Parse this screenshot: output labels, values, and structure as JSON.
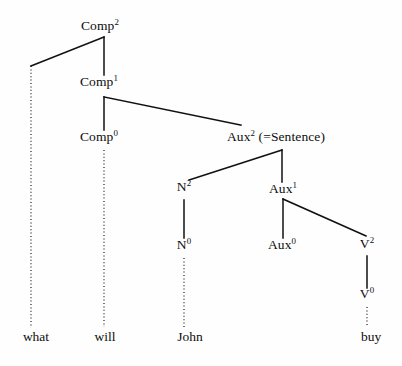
{
  "figure": {
    "background_color": "#fefefe",
    "line_color": "#111111",
    "text_color": "#0d0d0d"
  },
  "nodes": [
    {
      "id": "comp2",
      "base": "Comp",
      "sup": "2",
      "suffix": "",
      "text": "Comp2",
      "x": 100,
      "y": 31
    },
    {
      "id": "comp1",
      "base": "Comp",
      "sup": "1",
      "suffix": "",
      "text": "Comp1",
      "x": 99,
      "y": 87
    },
    {
      "id": "comp0",
      "base": "Comp",
      "sup": "0",
      "suffix": "",
      "text": "Comp0",
      "x": 99,
      "y": 142
    },
    {
      "id": "aux2",
      "base": "Aux",
      "sup": "2",
      "suffix": " (=Sentence)",
      "text": "Aux2 (=Sentence)",
      "x": 276,
      "y": 142
    },
    {
      "id": "n2",
      "base": "N",
      "sup": "2",
      "suffix": "",
      "text": "N2",
      "x": 184,
      "y": 192
    },
    {
      "id": "aux1",
      "base": "Aux",
      "sup": "1",
      "suffix": "",
      "text": "Aux1",
      "x": 283,
      "y": 194
    },
    {
      "id": "n0",
      "base": "N",
      "sup": "0",
      "suffix": "",
      "text": "N0",
      "x": 184,
      "y": 250
    },
    {
      "id": "aux0",
      "base": "Aux",
      "sup": "0",
      "suffix": "",
      "text": "Aux0",
      "x": 282,
      "y": 250
    },
    {
      "id": "v2",
      "base": "V",
      "sup": "2",
      "suffix": "",
      "text": "V2",
      "x": 367,
      "y": 249
    },
    {
      "id": "v0",
      "base": "V",
      "sup": "0",
      "suffix": "",
      "text": "V0",
      "x": 367,
      "y": 299
    }
  ],
  "terminals": [
    {
      "id": "what",
      "label": "what",
      "x": 36,
      "y": 342
    },
    {
      "id": "will",
      "label": "will",
      "x": 105,
      "y": 342
    },
    {
      "id": "john",
      "label": "John",
      "x": 190,
      "y": 342
    },
    {
      "id": "buy",
      "label": "buy",
      "x": 371,
      "y": 342
    }
  ],
  "edges": [
    {
      "id": "comp2-trace-left",
      "from": "comp2",
      "to": "wh-trace",
      "style": "solid",
      "x1": 104,
      "y1": 37,
      "x2": 31,
      "y2": 66
    },
    {
      "id": "comp2-comp1",
      "from": "comp2",
      "to": "comp1",
      "style": "solid",
      "x1": 104,
      "y1": 37,
      "x2": 104,
      "y2": 75
    },
    {
      "id": "comp1-comp0",
      "from": "comp1",
      "to": "comp0",
      "style": "solid",
      "x1": 104,
      "y1": 97,
      "x2": 104,
      "y2": 130
    },
    {
      "id": "comp1-aux2",
      "from": "comp1",
      "to": "aux2",
      "style": "solid",
      "x1": 104,
      "y1": 97,
      "x2": 241,
      "y2": 125
    },
    {
      "id": "aux2-n2",
      "from": "aux2",
      "to": "n2",
      "style": "solid",
      "x1": 282,
      "y1": 150,
      "x2": 189,
      "y2": 180
    },
    {
      "id": "aux2-aux1",
      "from": "aux2",
      "to": "aux1",
      "style": "solid",
      "x1": 282,
      "y1": 150,
      "x2": 282,
      "y2": 182
    },
    {
      "id": "n2-n0",
      "from": "n2",
      "to": "n0",
      "style": "solid",
      "x1": 184,
      "y1": 200,
      "x2": 184,
      "y2": 238
    },
    {
      "id": "aux1-aux0",
      "from": "aux1",
      "to": "aux0",
      "style": "solid",
      "x1": 283,
      "y1": 199,
      "x2": 283,
      "y2": 238
    },
    {
      "id": "aux1-v2",
      "from": "aux1",
      "to": "v2",
      "style": "solid",
      "x1": 283,
      "y1": 199,
      "x2": 366,
      "y2": 236
    },
    {
      "id": "v2-v0",
      "from": "v2",
      "to": "v0",
      "style": "solid",
      "x1": 367,
      "y1": 256,
      "x2": 367,
      "y2": 288
    },
    {
      "id": "trace-what",
      "from": "wh-trace",
      "to": "what",
      "style": "dotted",
      "x1": 31,
      "y1": 66,
      "x2": 31,
      "y2": 327
    },
    {
      "id": "comp0-will",
      "from": "comp0",
      "to": "will",
      "style": "dotted",
      "x1": 104,
      "y1": 150,
      "x2": 104,
      "y2": 327
    },
    {
      "id": "n0-john",
      "from": "n0",
      "to": "john",
      "style": "dotted",
      "x1": 184,
      "y1": 258,
      "x2": 184,
      "y2": 327
    },
    {
      "id": "v0-buy",
      "from": "v0",
      "to": "buy",
      "style": "dotted",
      "x1": 367,
      "y1": 307,
      "x2": 367,
      "y2": 327
    }
  ]
}
